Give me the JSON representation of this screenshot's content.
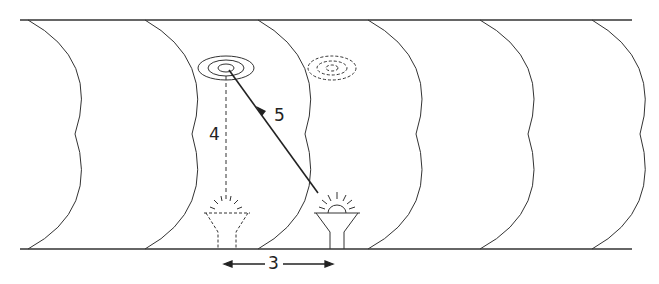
{
  "diagram": {
    "labels": {
      "horizontal_distance": "3",
      "vertical_distance": "4",
      "diagonal_distance": "5"
    },
    "elements": {
      "tunnel": "cylindrical tunnel with 6 curved cross-section rings",
      "light_source": "lamp emitting light rays",
      "reflected_target": "concentric ellipse target on ceiling",
      "ghost_target": "dashed concentric ellipse (virtual image)",
      "ghost_source": "dashed lamp (virtual position)"
    },
    "colors": {
      "stroke": "#333333"
    }
  }
}
